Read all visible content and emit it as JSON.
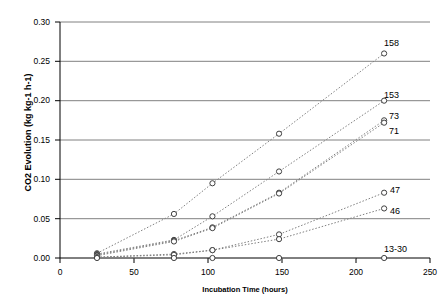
{
  "chart_data": {
    "type": "scatter",
    "title": "",
    "xlabel": "Incubation Time (hours)",
    "ylabel": "CO2 Evolution (kg kg-1 h-1)",
    "xlim": [
      0,
      250
    ],
    "ylim": [
      0.0,
      0.3
    ],
    "xticks": [
      0,
      50,
      100,
      150,
      200,
      250
    ],
    "yticks": [
      "0.00",
      "0.05",
      "0.10",
      "0.15",
      "0.20",
      "0.25",
      "0.30"
    ],
    "grid": "horizontal",
    "legend_position": "right-inline-end-of-series",
    "marker": "open-circle",
    "linestyle": "dotted",
    "series": [
      {
        "name": "158",
        "label": "158",
        "x": [
          25,
          77,
          103,
          148,
          219
        ],
        "values": [
          0.006,
          0.056,
          0.095,
          0.158,
          0.26
        ]
      },
      {
        "name": "153",
        "label": "153",
        "x": [
          25,
          77,
          103,
          148,
          219
        ],
        "values": [
          0.005,
          0.023,
          0.053,
          0.11,
          0.2
        ]
      },
      {
        "name": "73",
        "label": "73",
        "x": [
          25,
          77,
          103,
          148,
          219
        ],
        "values": [
          0.004,
          0.022,
          0.039,
          0.083,
          0.175
        ]
      },
      {
        "name": "71",
        "label": "71",
        "x": [
          25,
          77,
          103,
          148,
          219
        ],
        "values": [
          0.003,
          0.021,
          0.038,
          0.082,
          0.172
        ]
      },
      {
        "name": "47",
        "label": "47",
        "x": [
          25,
          77,
          103,
          148,
          219
        ],
        "values": [
          0.001,
          0.005,
          0.01,
          0.03,
          0.083
        ]
      },
      {
        "name": "46",
        "label": "46",
        "x": [
          25,
          77,
          103,
          148,
          219
        ],
        "values": [
          0.001,
          0.004,
          0.01,
          0.024,
          0.063
        ]
      },
      {
        "name": "13-30",
        "label": "13-30",
        "x": [
          25,
          77,
          103,
          148,
          219
        ],
        "values": [
          0.0,
          0.0,
          0.0,
          0.0,
          0.0
        ]
      }
    ]
  },
  "axes": {
    "y_title": "CO2 Evolution (kg kg-1 h-1)",
    "x_title": "Incubation Time (hours)",
    "y_tick_labels": [
      "0.30",
      "0.25",
      "0.20",
      "0.15",
      "0.10",
      "0.05",
      "0.00"
    ],
    "x_tick_labels": [
      "0",
      "50",
      "100",
      "150",
      "200",
      "250"
    ]
  },
  "colors": {
    "axis": "#000000",
    "grid": "#808080",
    "marker_stroke": "#404040",
    "line": "#808080",
    "background": "#ffffff"
  }
}
